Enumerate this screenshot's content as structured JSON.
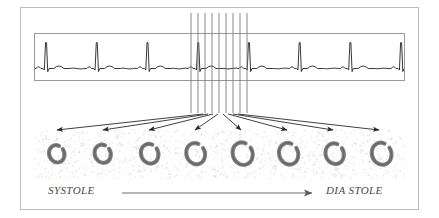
{
  "figure": {
    "name": "gated-blood-pool-cardiac-cycle-figure",
    "border_color": "#bdbdbd",
    "background": "#ffffff"
  },
  "ecg": {
    "panel_name": "ecg-rhythm-strip",
    "border_color": "#9a9a9a",
    "trace_color": "#1a1a1a",
    "beats": 7,
    "baseline_y": 36,
    "r_peak_x": [
      11,
      62,
      113,
      164,
      215,
      266,
      317,
      368
    ],
    "description": "ECG rhythm strip with repeating P-QRS-T complexes"
  },
  "gating": {
    "name": "r-to-r-gating-lines",
    "line_color": "#7a7a7a",
    "count": 9,
    "x_positions": [
      191,
      198,
      205,
      212,
      219,
      226,
      233,
      240,
      247
    ],
    "top_y": 13,
    "bottom_y": 113,
    "description": "Nine vertical gating markers dividing one R-R interval into eight frames"
  },
  "arrows": {
    "name": "frame-fan-arrows",
    "color": "#2a2a2a",
    "count": 8,
    "origin_y": 114,
    "target_y": 130,
    "origins_x": [
      203,
      208,
      213,
      218,
      223,
      228,
      233,
      238
    ],
    "targets_x": [
      57,
      103,
      149,
      195,
      241,
      287,
      333,
      379
    ]
  },
  "frames": {
    "name": "ventricular-frame-strip",
    "count": 8,
    "left": 34,
    "top": 129,
    "cell_width": 46,
    "cell_gap": 0,
    "spacing": 46.4,
    "wall_color": "#6b6b6b",
    "speckle_color": "#b9b9b9",
    "items": [
      {
        "index": 1,
        "phase": "end-systole",
        "cavity_scale": 0.72
      },
      {
        "index": 2,
        "phase": "early-ejection",
        "cavity_scale": 0.76
      },
      {
        "index": 3,
        "phase": "mid-filling",
        "cavity_scale": 0.82
      },
      {
        "index": 4,
        "phase": "rapid-filling",
        "cavity_scale": 0.88
      },
      {
        "index": 5,
        "phase": "diastasis",
        "cavity_scale": 0.94
      },
      {
        "index": 6,
        "phase": "late-filling",
        "cavity_scale": 0.9
      },
      {
        "index": 7,
        "phase": "atrial-kick",
        "cavity_scale": 0.86
      },
      {
        "index": 8,
        "phase": "end-diastole",
        "cavity_scale": 0.92
      }
    ]
  },
  "axis": {
    "name": "cardiac-phase-axis",
    "systole_label": "SYSTOLE",
    "diastole_label": "DIA STOLE",
    "arrow_color": "#6f6f6f",
    "text_color": "#4a4a4a"
  }
}
